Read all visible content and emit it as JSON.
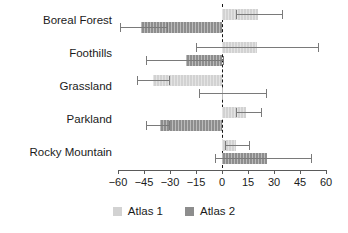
{
  "chart_data": {
    "type": "bar",
    "orientation": "horizontal",
    "title": "",
    "xlabel": "",
    "ylabel": "",
    "categories": [
      "Boreal Forest",
      "Foothills",
      "Grassland",
      "Parkland",
      "Rocky Mountain"
    ],
    "xlim": [
      -60,
      60
    ],
    "xticks": [
      -60,
      -45,
      -30,
      -15,
      0,
      15,
      30,
      45,
      60
    ],
    "xticklabels": [
      "−60",
      "−45",
      "−30",
      "−15",
      "0",
      "15",
      "30",
      "45",
      "60"
    ],
    "grid": false,
    "zero_reference_line": 0,
    "legend": {
      "position": "bottom",
      "entries": [
        "Atlas 1",
        "Atlas 2"
      ]
    },
    "series": [
      {
        "name": "Atlas 1",
        "color": "#d2d2d2",
        "values": [
          21,
          20,
          -40,
          14,
          8
        ],
        "ci_low": [
          8,
          -15,
          -49,
          8,
          2
        ],
        "ci_high": [
          35,
          56,
          -30,
          23,
          16
        ]
      },
      {
        "name": "Atlas 2",
        "color": "#8d8d8d",
        "values": [
          -47,
          -21,
          0,
          -36,
          26
        ],
        "ci_low": [
          -59,
          -44,
          -13,
          -44,
          -4
        ],
        "ci_high": [
          -31,
          1,
          26,
          -30,
          52
        ]
      }
    ]
  },
  "legend": {
    "items": [
      {
        "label": "Atlas 1",
        "color": "#d2d2d2"
      },
      {
        "label": "Atlas 2",
        "color": "#8d8d8d"
      }
    ]
  }
}
